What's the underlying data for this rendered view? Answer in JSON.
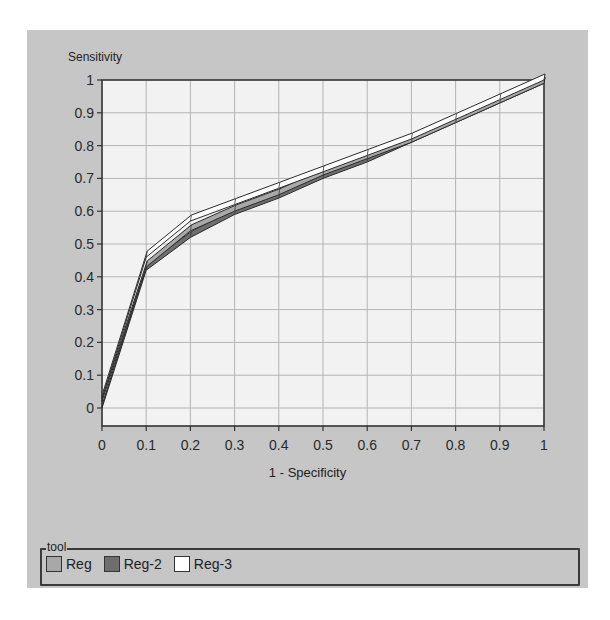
{
  "header": {
    "title_clipped": ""
  },
  "chart_data": {
    "type": "line",
    "title": "",
    "xlabel": "1 - Specificity",
    "ylabel": "Sensitivity",
    "xlim": [
      0,
      1
    ],
    "ylim": [
      0,
      1
    ],
    "grid": true,
    "legend_position": "bottom",
    "legend_title": "tool",
    "x": [
      0,
      0.1,
      0.2,
      0.3,
      0.4,
      0.5,
      0.6,
      0.7,
      0.8,
      0.9,
      1.0
    ],
    "x_ticks": [
      "0",
      "0.1",
      "0.2",
      "0.3",
      "0.4",
      "0.5",
      "0.6",
      "0.7",
      "0.8",
      "0.9",
      "1"
    ],
    "y_ticks": [
      "0",
      "0.1",
      "0.2",
      "0.3",
      "0.4",
      "0.5",
      "0.6",
      "0.7",
      "0.8",
      "0.9",
      "1"
    ],
    "series": [
      {
        "name": "Reg",
        "color": "#a8a8a8",
        "values": [
          0.02,
          0.43,
          0.54,
          0.6,
          0.65,
          0.71,
          0.76,
          0.81,
          0.87,
          0.93,
          0.99
        ]
      },
      {
        "name": "Reg-2",
        "color": "#6e6e6e",
        "values": [
          0.0,
          0.42,
          0.52,
          0.59,
          0.64,
          0.7,
          0.75,
          0.81,
          0.87,
          0.93,
          0.99
        ]
      },
      {
        "name": "Reg-3",
        "color": "#ffffff",
        "values": [
          0.03,
          0.46,
          0.57,
          0.62,
          0.67,
          0.72,
          0.77,
          0.82,
          0.88,
          0.94,
          1.0
        ]
      }
    ]
  },
  "legend": {
    "title": "tool",
    "items": [
      {
        "label": "Reg",
        "color": "#a8a8a8"
      },
      {
        "label": "Reg-2",
        "color": "#6e6e6e"
      },
      {
        "label": "Reg-3",
        "color": "#ffffff"
      }
    ]
  },
  "colors": {
    "panel_bg": "#c6c6c6",
    "plot_bg": "#f2f2f2",
    "grid": "#b4b4b4",
    "axis": "#333333"
  }
}
